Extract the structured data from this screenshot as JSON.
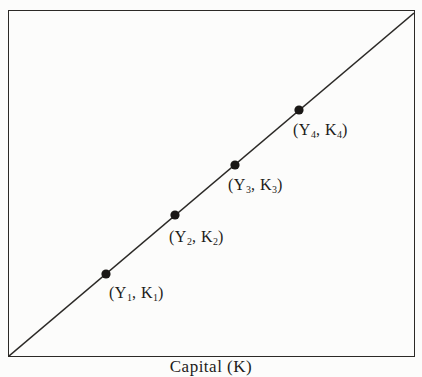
{
  "figure": {
    "xlabel": "Capital (K)",
    "background": "#fcfcfb",
    "line_color": "#2b2926",
    "dot_color": "#1a1816"
  },
  "points": [
    {
      "pre": "(Y",
      "sub1": "1",
      "mid": ", K",
      "sub2": "1",
      "post": ")"
    },
    {
      "pre": "(Y",
      "sub1": "2",
      "mid": ", K",
      "sub2": "2",
      "post": ")"
    },
    {
      "pre": "(Y",
      "sub1": "3",
      "mid": ", K",
      "sub2": "3",
      "post": ")"
    },
    {
      "pre": "(Y",
      "sub1": "4",
      "mid": ", K",
      "sub2": "4",
      "post": ")"
    }
  ]
}
